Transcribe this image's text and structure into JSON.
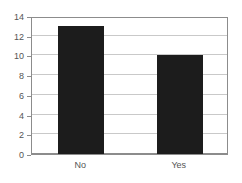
{
  "chart_data": {
    "type": "bar",
    "title": "",
    "subtitle": "",
    "xlabel": "",
    "ylabel": "",
    "categories": [
      "No",
      "Yes"
    ],
    "values": [
      13,
      10
    ],
    "series": [
      {
        "name": "count",
        "values": [
          13,
          10
        ]
      }
    ],
    "ylim": [
      0,
      14
    ],
    "ytick_labels": [
      "0",
      "2",
      "4",
      "6",
      "8",
      "10",
      "12",
      "14"
    ],
    "ytick_values": [
      0,
      2,
      4,
      6,
      8,
      10,
      12,
      14
    ],
    "xtick_labels": [
      "No",
      "Yes"
    ],
    "grid": "horizontal",
    "legend": "none",
    "annotations": [],
    "colors": {
      "bar_fill": "#1c1c1c",
      "gridline": "#c9c9c9",
      "axis": "#8c8c8c",
      "tick_label": "#555555",
      "background": "#ffffff"
    }
  }
}
